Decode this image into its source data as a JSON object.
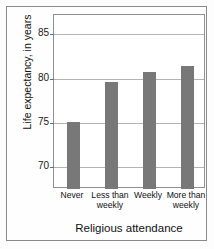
{
  "chart_data": {
    "type": "bar",
    "title": "",
    "xlabel": "Religious attendance",
    "ylabel": "Life expectancy, in years",
    "categories": [
      "Never",
      "Less than weekly",
      "Weekly",
      "More than weekly"
    ],
    "category_lines": [
      [
        "Never"
      ],
      [
        "Less than",
        "weekly"
      ],
      [
        "Weekly"
      ],
      [
        "More than",
        "weekly"
      ]
    ],
    "values": [
      75.1,
      79.6,
      80.8,
      81.4
    ],
    "ylim": [
      67.5,
      87.2
    ],
    "yticks": [
      70,
      75,
      80,
      85
    ],
    "ytick_labels": [
      "70",
      "75",
      "80",
      "85"
    ],
    "grid": true,
    "legend": null,
    "bar_color": "#787878",
    "gridline_color": "#b4b4b4",
    "frame_color": "#909090"
  }
}
